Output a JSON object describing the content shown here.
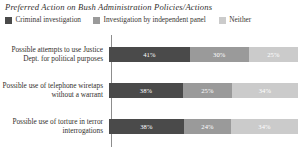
{
  "chart": {
    "title": "Preferred Action on Bush Administration Policies/Actions"
  },
  "legend": {
    "items": [
      {
        "label": "Criminal investigation",
        "color": "#4a4a4a",
        "swatch_icon": "legend-swatch-icon"
      },
      {
        "label": "Investigation by independent panel",
        "color": "#9a9a9a",
        "swatch_icon": "legend-swatch-icon"
      },
      {
        "label": "Neither",
        "color": "#cbcbcb",
        "swatch_icon": "legend-swatch-icon"
      }
    ]
  },
  "rows": [
    {
      "label": "Possible attempts to use Justice Dept. for political purposes",
      "values": [
        "41%",
        "30%",
        "25%"
      ]
    },
    {
      "label": "Possible use of telephone wiretaps without a warrant",
      "values": [
        "38%",
        "25%",
        "34%"
      ]
    },
    {
      "label": "Possible use of torture in terror interrogations",
      "values": [
        "38%",
        "24%",
        "34%"
      ]
    }
  ],
  "chart_data": {
    "type": "bar",
    "orientation": "horizontal",
    "stacked": true,
    "title": "Preferred Action on Bush Administration Policies/Actions",
    "xlabel": "",
    "ylabel": "",
    "xlim": [
      0,
      100
    ],
    "grid": false,
    "legend_position": "top-left",
    "categories": [
      "Possible attempts to use Justice Dept. for political purposes",
      "Possible use of telephone wiretaps without a warrant",
      "Possible use of torture in terror interrogations"
    ],
    "series": [
      {
        "name": "Criminal investigation",
        "color": "#4a4a4a",
        "values": [
          41,
          38,
          38
        ]
      },
      {
        "name": "Investigation by independent panel",
        "color": "#9a9a9a",
        "values": [
          30,
          25,
          24
        ]
      },
      {
        "name": "Neither",
        "color": "#cbcbcb",
        "values": [
          25,
          34,
          34
        ]
      }
    ],
    "value_labels": [
      [
        "41%",
        "30%",
        "25%"
      ],
      [
        "38%",
        "25%",
        "34%"
      ],
      [
        "38%",
        "24%",
        "34%"
      ]
    ],
    "units": "percent"
  }
}
